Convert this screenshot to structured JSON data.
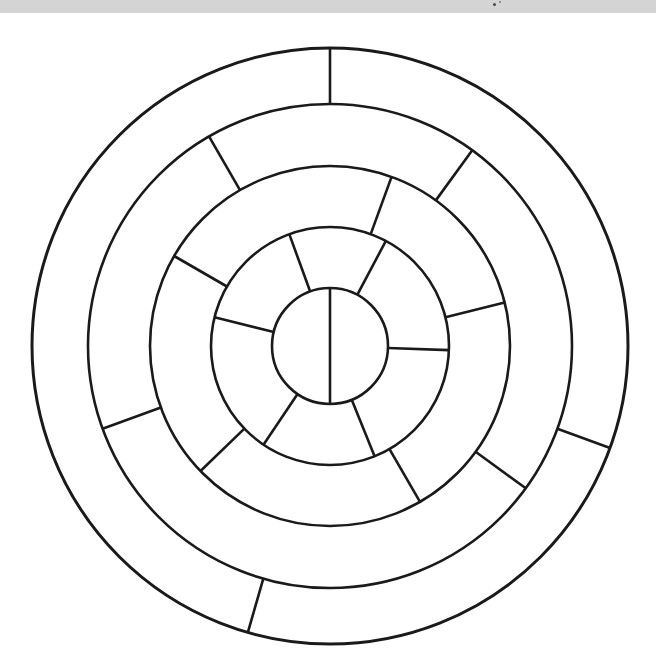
{
  "page": {
    "background_color": "#ffffff",
    "width": 656,
    "height": 667
  },
  "top_band": {
    "name": "scanned-page-edge-band",
    "color": "#d4d4d4",
    "height": 13,
    "specks": [
      {
        "x": 493,
        "y": 3,
        "size": 3,
        "color": "#4a4a4a"
      },
      {
        "x": 499,
        "y": 1,
        "size": 2,
        "color": "#7a7a7a"
      }
    ]
  },
  "chart_data": {
    "type": "pie",
    "title": "",
    "subtitle": "",
    "xlabel": "",
    "ylabel": "",
    "legend": [],
    "annotations": [],
    "grid": false,
    "style": {
      "stroke_color": "#1a1a1a",
      "fill_color": "none",
      "stroke_width_outer": 3.0,
      "stroke_width_ring": 2.6,
      "stroke_width_spoke": 2.6
    },
    "center": {
      "x": 330,
      "y": 333
    },
    "radii": [
      58,
      119,
      180,
      242,
      298
    ],
    "ring_count": 5,
    "rings": [
      {
        "index": 1,
        "name": "inner-disc",
        "inner_radius": 0,
        "outer_radius": 58,
        "sector_count": 2,
        "divider_angles_deg": [
          0,
          180
        ],
        "sector_angular_spans_deg": [
          180,
          180
        ]
      },
      {
        "index": 2,
        "name": "ring-2",
        "inner_radius": 58,
        "outer_radius": 119,
        "sector_count": 6,
        "divider_angles_deg": [
          28,
          92,
          158,
          214,
          284,
          340
        ],
        "sector_angular_spans_deg": [
          64,
          66,
          56,
          70,
          56,
          48
        ]
      },
      {
        "index": 3,
        "name": "ring-3",
        "inner_radius": 119,
        "outer_radius": 180,
        "sector_count": 5,
        "divider_angles_deg": [
          20,
          76,
          150,
          226,
          300
        ],
        "sector_angular_spans_deg": [
          56,
          74,
          76,
          74,
          80
        ]
      },
      {
        "index": 4,
        "name": "ring-4",
        "inner_radius": 180,
        "outer_radius": 242,
        "sector_count": 4,
        "divider_angles_deg": [
          36,
          126,
          250,
          330
        ],
        "sector_angular_spans_deg": [
          90,
          124,
          80,
          66
        ]
      },
      {
        "index": 5,
        "name": "ring-5-outer",
        "inner_radius": 242,
        "outer_radius": 298,
        "sector_count": 3,
        "divider_angles_deg": [
          0,
          110,
          196
        ],
        "sector_angular_spans_deg": [
          110,
          86,
          164
        ]
      }
    ],
    "total_sectors": 20
  }
}
